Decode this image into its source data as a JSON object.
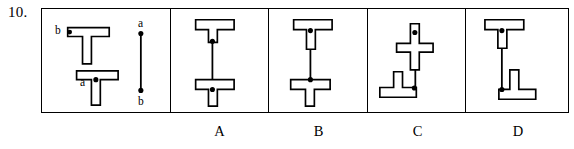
{
  "question": {
    "number": "10."
  },
  "reference_panel": {
    "name": "reference-figure",
    "objects": [
      {
        "id": "upper-tee",
        "label": "b",
        "label_position": "left-end-of-crossbar",
        "orientation": "tee-stem-down"
      },
      {
        "id": "lower-tee",
        "label": "a",
        "label_position": "center-junction",
        "orientation": "tee-stem-down"
      }
    ],
    "segment": {
      "id": "ab-segment",
      "top_label": "a",
      "bottom_label": "b"
    }
  },
  "options": [
    {
      "key": "A",
      "label": "A",
      "top_shape": "tee-stem-down",
      "top_point": "bottom-of-stem",
      "bottom_shape": "tee-stem-down",
      "bottom_point": "center-junction"
    },
    {
      "key": "B",
      "label": "B",
      "top_shape": "tee-stem-down",
      "top_point": "center-junction",
      "bottom_shape": "tee-stem-down",
      "bottom_point": "top-center-of-crossbar"
    },
    {
      "key": "C",
      "label": "C",
      "top_shape": "cross-stem-up",
      "top_point": "above-crossbar",
      "bottom_shape": "inverted-tee",
      "bottom_point": "right-end-of-base"
    },
    {
      "key": "D",
      "label": "D",
      "top_shape": "tee-stem-down",
      "top_point": "center-junction",
      "bottom_shape": "inverted-tee",
      "bottom_point": "left-end-of-base"
    }
  ],
  "colors": {
    "ink": "#000000",
    "paper": "#ffffff"
  }
}
